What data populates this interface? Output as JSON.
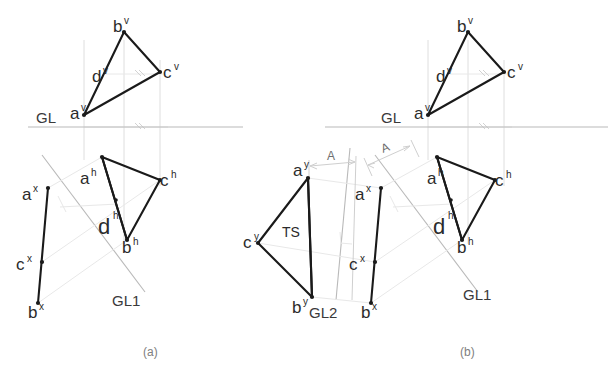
{
  "figure": {
    "background_color": "#ffffff",
    "line_color": "#1a1a1a",
    "reference_line_color": "#b9b9b9",
    "projector_color": "#dedede",
    "label_color": "#2b2b2b",
    "caption_color": "#808080"
  },
  "captions": {
    "left": "(a)",
    "right": "(b)"
  },
  "panel_a": {
    "ground_line_label": "GL",
    "aux_line_label": "GL1",
    "vertical_view": {
      "points": [
        {
          "name": "a-v",
          "base": "a",
          "sup": "v",
          "x": 84,
          "y": 115
        },
        {
          "name": "b-v",
          "base": "b",
          "sup": "v",
          "x": 124,
          "y": 32
        },
        {
          "name": "c-v",
          "base": "c",
          "sup": "v",
          "x": 160,
          "y": 72
        },
        {
          "name": "d-v",
          "base": "d",
          "sup": "v",
          "x": 103,
          "y": 74
        }
      ]
    },
    "horizontal_view": {
      "points": [
        {
          "name": "a-h",
          "base": "a",
          "sup": "h",
          "x": 102,
          "y": 157
        },
        {
          "name": "b-h",
          "base": "b",
          "sup": "h",
          "x": 127,
          "y": 240
        },
        {
          "name": "c-h",
          "base": "c",
          "sup": "h",
          "x": 160,
          "y": 180
        },
        {
          "name": "d-h",
          "base": "d",
          "sup": "h",
          "x": 115,
          "y": 202
        }
      ]
    },
    "auxiliary_view": {
      "points": [
        {
          "name": "a-x",
          "base": "a",
          "sup": "x",
          "x": 48,
          "y": 188
        },
        {
          "name": "c-x",
          "base": "c",
          "sup": "x",
          "x": 42,
          "y": 262
        },
        {
          "name": "b-x",
          "base": "b",
          "sup": "x",
          "x": 38,
          "y": 303
        }
      ]
    }
  },
  "panel_b": {
    "ground_line_label": "GL",
    "aux_line_label": "GL1",
    "aux_line_label_2": "GL2",
    "true_shape_label": "TS",
    "dimension_label": "A",
    "vertical_view": {
      "points": [
        {
          "name": "a-v",
          "base": "a",
          "sup": "v",
          "x": 428,
          "y": 115
        },
        {
          "name": "b-v",
          "base": "b",
          "sup": "v",
          "x": 468,
          "y": 32
        },
        {
          "name": "c-v",
          "base": "c",
          "sup": "v",
          "x": 504,
          "y": 72
        },
        {
          "name": "d-v",
          "base": "d",
          "sup": "v",
          "x": 447,
          "y": 74
        }
      ]
    },
    "horizontal_view": {
      "points": [
        {
          "name": "a-h",
          "base": "a",
          "sup": "h",
          "x": 437,
          "y": 157
        },
        {
          "name": "b-h",
          "base": "b",
          "sup": "h",
          "x": 462,
          "y": 240
        },
        {
          "name": "c-h",
          "base": "c",
          "sup": "h",
          "x": 495,
          "y": 180
        },
        {
          "name": "d-h",
          "base": "d",
          "sup": "h",
          "x": 450,
          "y": 202
        }
      ]
    },
    "auxiliary_view": {
      "points": [
        {
          "name": "a-x",
          "base": "a",
          "sup": "x",
          "x": 381,
          "y": 188
        },
        {
          "name": "c-x",
          "base": "c",
          "sup": "x",
          "x": 375,
          "y": 262
        },
        {
          "name": "b-x",
          "base": "b",
          "sup": "x",
          "x": 371,
          "y": 303
        }
      ]
    },
    "true_shape_view": {
      "points": [
        {
          "name": "a-y",
          "base": "a",
          "sup": "y",
          "x": 308,
          "y": 178
        },
        {
          "name": "c-y",
          "base": "c",
          "sup": "y",
          "x": 258,
          "y": 243
        },
        {
          "name": "b-y",
          "base": "b",
          "sup": "y",
          "x": 312,
          "y": 297
        }
      ]
    }
  }
}
